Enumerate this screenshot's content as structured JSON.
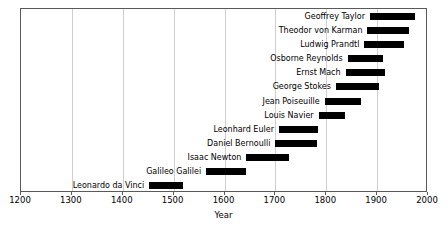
{
  "chart_data": {
    "type": "bar",
    "orientation": "horizontal",
    "subtype": "timeline-range-bars",
    "title": "",
    "xlabel": "Year",
    "ylabel": "",
    "xlim": [
      1200,
      2000
    ],
    "xticks": [
      1200,
      1300,
      1400,
      1500,
      1600,
      1700,
      1800,
      1900,
      2000
    ],
    "xtick_labels": [
      "1200",
      "1300",
      "1400",
      "1500",
      "1600",
      "1700",
      "1800",
      "1900",
      "2000"
    ],
    "grid": "vertical",
    "legend": "none",
    "bar_color": "#000000",
    "categories": [
      "Geoffrey Taylor",
      "Theodor von Karman",
      "Ludwig Prandtl",
      "Osborne Reynolds",
      "Ernst Mach",
      "George Stokes",
      "Jean Poiseuille",
      "Louis Navier",
      "Leonhard Euler",
      "Daniel Bernoulli",
      "Isaac Newton",
      "Galileo Galilei",
      "Leonardo da Vinci"
    ],
    "ranges": [
      {
        "label": "Geoffrey Taylor",
        "start": 1886,
        "end": 1975
      },
      {
        "label": "Theodor von Karman",
        "start": 1881,
        "end": 1963
      },
      {
        "label": "Ludwig Prandtl",
        "start": 1875,
        "end": 1953
      },
      {
        "label": "Osborne Reynolds",
        "start": 1842,
        "end": 1912
      },
      {
        "label": "Ernst Mach",
        "start": 1838,
        "end": 1916
      },
      {
        "label": "George Stokes",
        "start": 1819,
        "end": 1903
      },
      {
        "label": "Jean Poiseuille",
        "start": 1797,
        "end": 1869
      },
      {
        "label": "Louis Navier",
        "start": 1785,
        "end": 1836
      },
      {
        "label": "Leonhard Euler",
        "start": 1707,
        "end": 1783
      },
      {
        "label": "Daniel Bernoulli",
        "start": 1700,
        "end": 1782
      },
      {
        "label": "Isaac Newton",
        "start": 1643,
        "end": 1727
      },
      {
        "label": "Galileo Galilei",
        "start": 1564,
        "end": 1642
      },
      {
        "label": "Leonardo da Vinci",
        "start": 1452,
        "end": 1519
      }
    ]
  }
}
